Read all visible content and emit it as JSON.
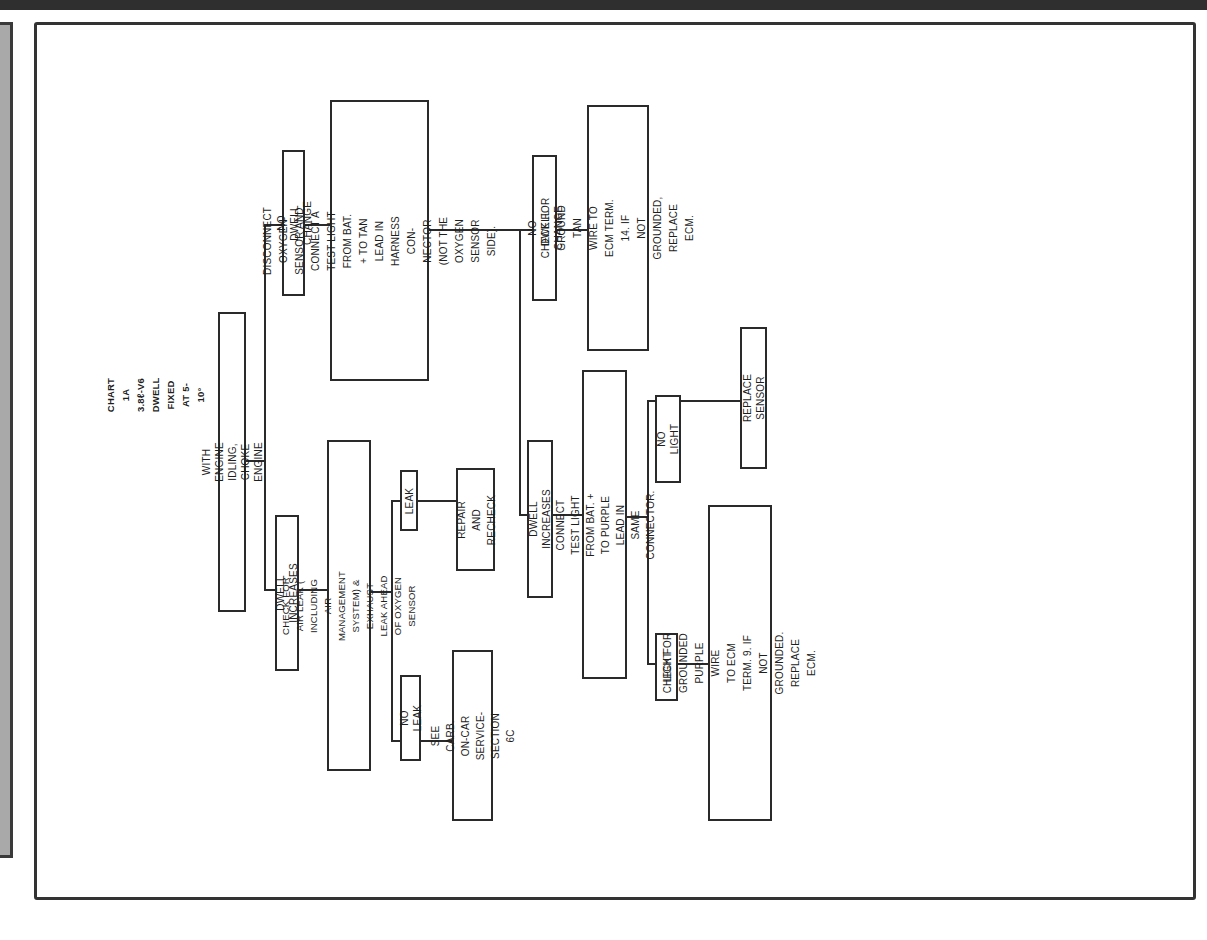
{
  "chart": {
    "title": "CHART 1A",
    "engine": "3.8ℓ-V6",
    "subtitle": "DWELL FIXED AT 5-10°"
  },
  "nodes": {
    "root": "WITH ENGINE IDLING, CHOKE ENGINE",
    "no_dwell_change_1": "NO DWELL CHANGE",
    "disconnect_sensor": "DISCONNECT OXYGEN SENSOR AND\nCONNECT A TEST LIGHT FROM BAT.\n+ TO TAN LEAD IN HARNESS CON-\nNECTOR (NOT THE OXYGEN SENSOR\nSIDE).",
    "dwell_increases_1": "DWELL INCREASES",
    "check_air_leak": "CHECK FOR AIR LEAK ( INCLUDING AIR MANAGEMENT\nSYSTEM) & EXHAUST LEAK AHEAD OF OXYGEN SENSOR",
    "leak": "LEAK",
    "repair_recheck": "REPAIR AND\nRECHECK",
    "no_leak": "NO LEAK",
    "see_carb": "SEE CARB. ON-CAR\nSERVICE-SECTION 6C",
    "no_dwell_change_2": "NO DWELL CHANGE",
    "check_ground_tan": "CHECK FOR GROUND TAN\nWIRE TO ECM TERM. 14. IF\nNOT GROUNDED, REPLACE ECM.",
    "dwell_increases_2": "DWELL INCREASES",
    "connect_test_light": "CONNECT TEST LIGHT FROM BAT. +\nTO PURPLE LEAD IN SAME CONNECTOR.",
    "no_light": "NO LIGHT",
    "replace_sensor": "REPLACE SENSOR",
    "light": "LIGHT",
    "check_grounded_purple": "CHECK FOR GROUNDED PURPLE WIRE\nTO ECM TERM. 9. IF NOT GROUNDED.\nREPLACE ECM."
  },
  "colors": {
    "ink": "#2a2a2a",
    "strip": "#a9a9a9",
    "background": "#ffffff"
  }
}
